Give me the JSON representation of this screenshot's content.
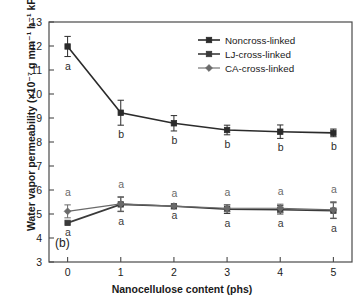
{
  "figure": {
    "panel_label": "(b)",
    "caption": ""
  },
  "chart_data": {
    "type": "line",
    "title": "",
    "xlabel": "Nanocellulose content (phs)",
    "ylabel": "Water vapor permeability (×10⁻⁷ g mm⁻¹ h⁻¹ kPa⁻¹)",
    "x": [
      0,
      1,
      2,
      3,
      4,
      5
    ],
    "xlim": [
      -0.35,
      5.35
    ],
    "ylim": [
      3,
      13
    ],
    "xticks": [
      "0",
      "1",
      "2",
      "3",
      "4",
      "5"
    ],
    "yticks": [
      "3",
      "4",
      "5",
      "6",
      "7",
      "8",
      "9",
      "10",
      "11",
      "12",
      "13"
    ],
    "grid": false,
    "legend_position": "top-right",
    "series": [
      {
        "name": "Noncross-linked",
        "marker": "square",
        "color": "#2b2b2b",
        "values": [
          11.98,
          9.22,
          8.78,
          8.5,
          8.43,
          8.38
        ],
        "errors": [
          0.42,
          0.52,
          0.32,
          0.2,
          0.28,
          0.16
        ],
        "labels": [
          "a",
          "b",
          "b",
          "b",
          "b",
          "b"
        ],
        "label_position": "below"
      },
      {
        "name": "LJ-cross-linked",
        "marker": "square",
        "color": "#3a3a3a",
        "values": [
          4.63,
          5.4,
          5.32,
          5.2,
          5.18,
          5.14
        ],
        "errors": [
          0.0,
          0.3,
          0.0,
          0.18,
          0.18,
          0.33
        ],
        "labels": [
          "a",
          "a",
          "a",
          "a",
          "a",
          "a"
        ],
        "label_position": "below"
      },
      {
        "name": "CA-cross-linked",
        "marker": "diamond",
        "color": "#6a6a6a",
        "values": [
          5.11,
          5.42,
          5.33,
          5.24,
          5.24,
          5.17
        ],
        "errors": [
          0.27,
          0.3,
          0.0,
          0.14,
          0.17,
          0.34
        ],
        "labels": [
          "a",
          "a",
          "a",
          "a",
          "a",
          "a"
        ],
        "label_position": "above"
      }
    ]
  }
}
